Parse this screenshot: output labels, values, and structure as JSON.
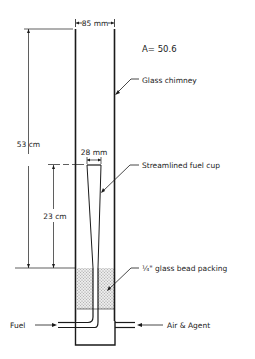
{
  "diagram": {
    "labels": {
      "chimney_width": "85 mm",
      "area_ratio": "A= 50.6",
      "chimney": "Glass chimney",
      "height_total": "53 cm",
      "cup_width": "28 mm",
      "fuel_cup": "Streamlined fuel cup",
      "height_cup": "23 cm",
      "packing": "¼\" glass bead packing",
      "fuel_inlet": "Fuel",
      "air_inlet": "Air & Agent"
    },
    "colors": {
      "line": "#1a1a1a",
      "packing_fill": "#d9d9d9"
    }
  }
}
